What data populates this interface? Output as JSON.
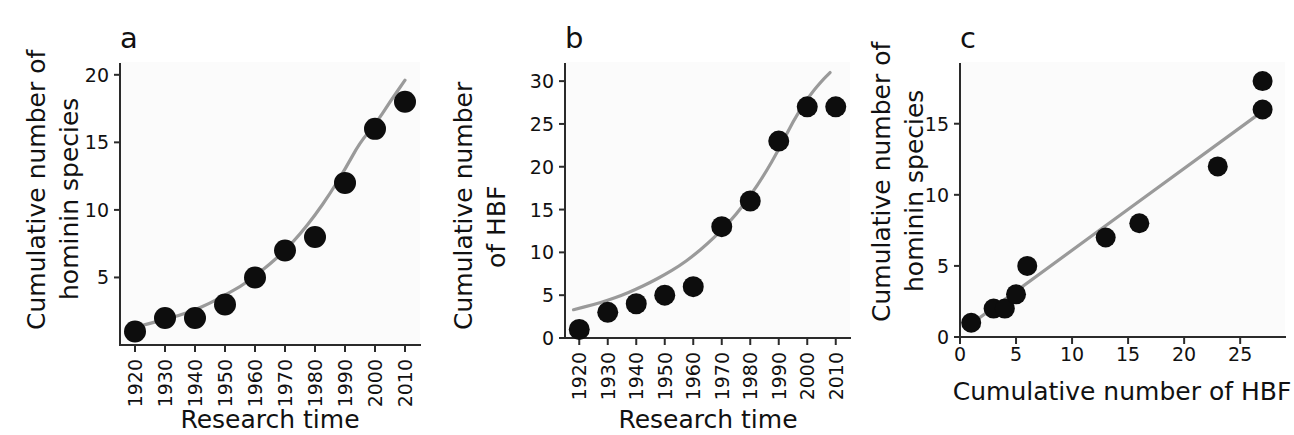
{
  "figure": {
    "background": "#ffffff",
    "point_color": "#0d0d0d",
    "fit_color": "#9a9a9a",
    "axis_color": "#2b2b2b"
  },
  "chart_data": [
    {
      "id": "panel-a",
      "panel_letter": "a",
      "type": "scatter",
      "title": "",
      "xlabel": "Research time",
      "ylabel": "Cumulative number of hominin species",
      "ylabel_lines": [
        "Cumulative number of",
        "hominin species"
      ],
      "x": [
        1920,
        1930,
        1940,
        1950,
        1960,
        1970,
        1980,
        1990,
        2000,
        2010
      ],
      "values": [
        1,
        2,
        2,
        3,
        5,
        7,
        8,
        12,
        16,
        18
      ],
      "xticks": [
        1920,
        1930,
        1940,
        1950,
        1960,
        1970,
        1980,
        1990,
        2000,
        2010
      ],
      "xtick_labels": [
        "1920",
        "1930",
        "1940",
        "1950",
        "1960",
        "1970",
        "1980",
        "1990",
        "2000",
        "2010"
      ],
      "xtick_rotation": -90,
      "yticks": [
        5,
        10,
        15,
        20
      ],
      "ytick_labels": [
        "5",
        "10",
        "15",
        "20"
      ],
      "xlim": [
        1915,
        2015
      ],
      "ylim": [
        0,
        20.8
      ],
      "grid": false,
      "legend": "none",
      "fit": {
        "type": "exponential",
        "label": "exponential trend line",
        "a": 1.05,
        "b": 0.0325,
        "x0": 1918,
        "points": [
          [
            1918,
            1.2
          ],
          [
            1925,
            1.6
          ],
          [
            1930,
            1.9
          ],
          [
            1935,
            2.2
          ],
          [
            1940,
            2.6
          ],
          [
            1945,
            3.1
          ],
          [
            1950,
            3.7
          ],
          [
            1955,
            4.3
          ],
          [
            1960,
            5.1
          ],
          [
            1965,
            6.0
          ],
          [
            1970,
            7.0
          ],
          [
            1975,
            8.2
          ],
          [
            1980,
            9.6
          ],
          [
            1985,
            11.2
          ],
          [
            1990,
            13.0
          ],
          [
            1995,
            15.0
          ],
          [
            2000,
            16.3
          ],
          [
            2005,
            18.0
          ],
          [
            2010,
            19.6
          ]
        ]
      }
    },
    {
      "id": "panel-b",
      "panel_letter": "b",
      "type": "scatter",
      "title": "",
      "xlabel": "Research time",
      "ylabel": "Cumulative number of HBF",
      "ylabel_lines": [
        "Cumulative number",
        "of HBF"
      ],
      "x": [
        1920,
        1930,
        1940,
        1950,
        1960,
        1970,
        1980,
        1990,
        2000,
        2010
      ],
      "values": [
        1,
        3,
        4,
        5,
        6,
        13,
        16,
        23,
        27,
        27
      ],
      "xticks": [
        1920,
        1930,
        1940,
        1950,
        1960,
        1970,
        1980,
        1990,
        2000,
        2010
      ],
      "xtick_labels": [
        "1920",
        "1930",
        "1940",
        "1950",
        "1960",
        "1970",
        "1980",
        "1990",
        "2000",
        "2010"
      ],
      "xtick_rotation": -90,
      "yticks": [
        0,
        5,
        10,
        15,
        20,
        25,
        30
      ],
      "ytick_labels": [
        "0",
        "5",
        "10",
        "15",
        "20",
        "25",
        "30"
      ],
      "xlim": [
        1915,
        2015
      ],
      "ylim": [
        0,
        32
      ],
      "grid": false,
      "legend": "none",
      "fit": {
        "type": "exponential",
        "label": "exponential trend line",
        "a": 3.3,
        "b": 0.0245,
        "x0": 1918,
        "points": [
          [
            1918,
            3.3
          ],
          [
            1925,
            3.9
          ],
          [
            1930,
            4.4
          ],
          [
            1935,
            5.0
          ],
          [
            1940,
            5.7
          ],
          [
            1945,
            6.5
          ],
          [
            1950,
            7.4
          ],
          [
            1955,
            8.4
          ],
          [
            1960,
            9.6
          ],
          [
            1965,
            11.0
          ],
          [
            1970,
            12.6
          ],
          [
            1975,
            14.4
          ],
          [
            1980,
            16.6
          ],
          [
            1985,
            19.1
          ],
          [
            1990,
            22.0
          ],
          [
            1995,
            25.3
          ],
          [
            2000,
            28.0
          ],
          [
            2005,
            30.0
          ],
          [
            2008,
            31.0
          ]
        ]
      }
    },
    {
      "id": "panel-c",
      "panel_letter": "c",
      "type": "scatter",
      "title": "",
      "xlabel": "Cumulative number of HBF",
      "ylabel": "Cumulative number of hominin species",
      "ylabel_lines": [
        "Cumulative number of",
        "hominin species"
      ],
      "x": [
        1,
        3,
        4,
        5,
        6,
        13,
        16,
        23,
        27,
        27
      ],
      "values": [
        1,
        2,
        2,
        3,
        5,
        7,
        8,
        12,
        16,
        18
      ],
      "xticks": [
        0,
        5,
        10,
        15,
        20,
        25
      ],
      "xtick_labels": [
        "0",
        "5",
        "10",
        "15",
        "20",
        "25"
      ],
      "xtick_rotation": 0,
      "yticks": [
        0,
        5,
        10,
        15
      ],
      "ytick_labels": [
        "0",
        "5",
        "10",
        "15"
      ],
      "xlim": [
        0,
        29
      ],
      "ylim": [
        0,
        19.2
      ],
      "grid": false,
      "legend": "none",
      "fit": {
        "type": "linear",
        "label": "linear regression line",
        "slope": 0.575,
        "intercept": 0.35,
        "points": [
          [
            0.8,
            0.81
          ],
          [
            27.2,
            15.99
          ]
        ]
      }
    }
  ]
}
